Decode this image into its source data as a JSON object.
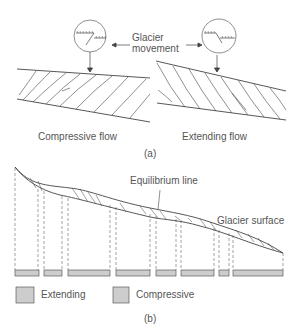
{
  "part_a": {
    "label": "(a)",
    "movement_label_line1": "Glacier",
    "movement_label_line2": "movement",
    "left_caption": "Compressive flow",
    "right_caption": "Extending flow"
  },
  "part_b": {
    "label": "(b)",
    "equilibrium_label": "Equilibrium line",
    "surface_label": "Glacier surface",
    "legend": [
      {
        "pattern": "horizontal-lines",
        "label": "Extending"
      },
      {
        "pattern": "vertical-lines",
        "label": "Compressive"
      }
    ],
    "zones": [
      "extending",
      "compressive",
      "extending",
      "compressive",
      "extending",
      "compressive",
      "extending",
      "compressive"
    ]
  },
  "colors": {
    "line": "#444444",
    "text": "#555555"
  }
}
